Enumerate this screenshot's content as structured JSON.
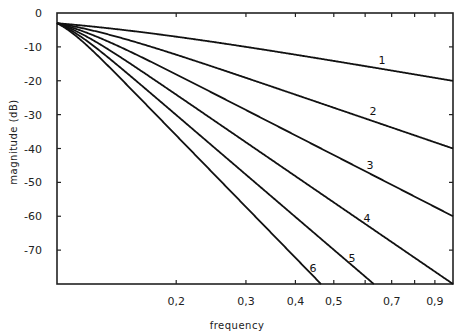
{
  "chart_data": {
    "type": "line",
    "title": "",
    "xlabel": "frequency",
    "ylabel": "magnitude (dB)",
    "xscale": "log",
    "xlim": [
      0.1,
      1.0
    ],
    "ylim": [
      -80,
      0
    ],
    "grid": false,
    "legend": "none (curves labeled inline 1-6)",
    "x_tick_labels": [
      "0.2",
      "0.3",
      "0.4",
      "0.5",
      "0.7",
      "0.9"
    ],
    "x_tick_positions": [
      0.2,
      0.3,
      0.4,
      0.5,
      0.6,
      0.7,
      0.8,
      0.9
    ],
    "y_tick_labels": [
      "0",
      "-10",
      "-20",
      "-30",
      "-40",
      "-50",
      "-60",
      "-70"
    ],
    "y_ticks": [
      0,
      -10,
      -20,
      -30,
      -40,
      -50,
      -60,
      -70
    ],
    "x": [
      0.1,
      0.2,
      0.3,
      0.4,
      0.5,
      0.6,
      0.7,
      0.8,
      0.9,
      1.0
    ],
    "series": [
      {
        "name": "1",
        "values": [
          -3.0,
          -7.0,
          -10.0,
          -12.3,
          -14.2,
          -15.7,
          -17.0,
          -18.1,
          -19.1,
          -20.0
        ]
      },
      {
        "name": "2",
        "values": [
          -3.0,
          -12.3,
          -19.1,
          -24.1,
          -28.0,
          -31.1,
          -33.8,
          -36.1,
          -38.2,
          -40.0
        ]
      },
      {
        "name": "3",
        "values": [
          -3.0,
          -18.1,
          -28.6,
          -36.1,
          -41.9,
          -46.7,
          -50.7,
          -54.2,
          -57.3,
          -60.0
        ]
      },
      {
        "name": "4",
        "values": [
          -3.0,
          -24.1,
          -38.2,
          -48.2,
          -55.9,
          -62.3,
          -67.6,
          -72.2,
          -76.3,
          -80.0
        ]
      },
      {
        "name": "5",
        "values": [
          -3.0,
          -30.1,
          -47.7,
          -60.2,
          -69.9,
          -77.8,
          null,
          null,
          null,
          null
        ]
      },
      {
        "name": "6",
        "values": [
          -3.0,
          -36.1,
          -57.3,
          -72.2,
          null,
          null,
          null,
          null,
          null,
          null
        ]
      }
    ],
    "annotations": [
      {
        "text": "1",
        "x": 0.7,
        "y": -14
      },
      {
        "text": "2",
        "x": 0.66,
        "y": -29
      },
      {
        "text": "3",
        "x": 0.65,
        "y": -45
      },
      {
        "text": "4",
        "x": 0.64,
        "y": -61
      },
      {
        "text": "5",
        "x": 0.59,
        "y": -73
      },
      {
        "text": "6",
        "x": 0.46,
        "y": -76
      }
    ]
  },
  "labels": {
    "xlabel": "frequency",
    "ylabel": "magnitude (dB)",
    "curves": [
      "1",
      "2",
      "3",
      "4",
      "5",
      "6"
    ]
  }
}
